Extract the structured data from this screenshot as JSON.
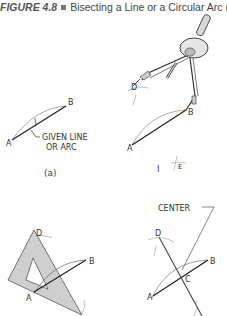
{
  "caption": {
    "figure_number": "FIGURE 4.8",
    "title": "Bisecting a Line or a Circular Arc (3"
  },
  "panels": {
    "a": {
      "label": "(a)",
      "point_a": "A",
      "point_b": "B",
      "note_line1": "GIVEN LINE",
      "note_line2": "OR ARC"
    },
    "i": {
      "label": "I",
      "point_a": "A",
      "point_b": "B",
      "point_d": "D",
      "point_e": "E"
    },
    "ii": {
      "point_a": "A",
      "point_b": "B",
      "point_d": "D"
    },
    "iii": {
      "center_label": "CENTER",
      "point_a": "A",
      "point_b": "B",
      "point_c": "C",
      "point_d": "D"
    }
  },
  "colors": {
    "ink": "#333333",
    "light_ink": "#888888",
    "triangle_fill": "#cfcfcf"
  }
}
